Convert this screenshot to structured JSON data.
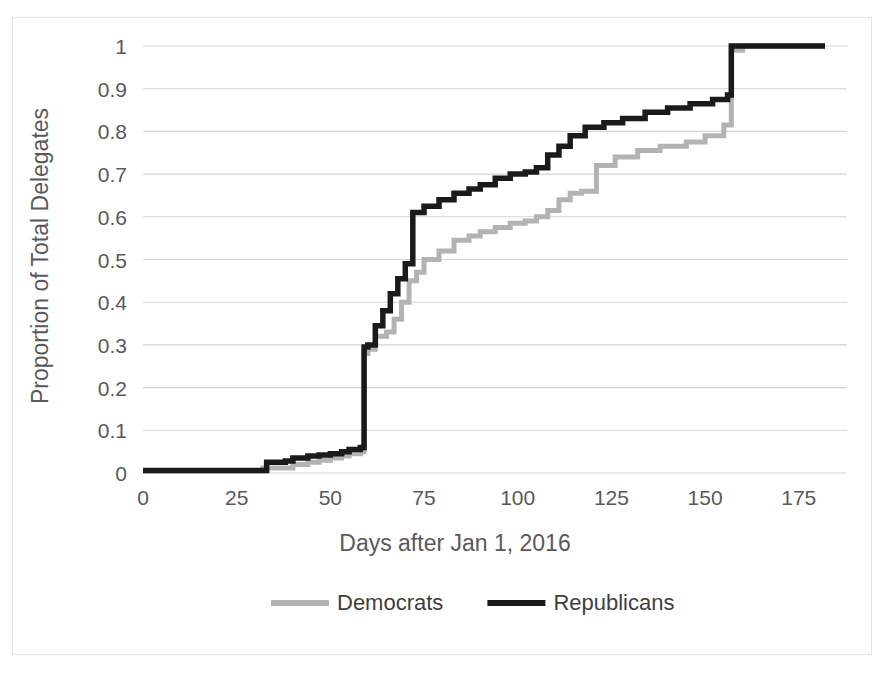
{
  "chart_data": {
    "type": "line",
    "title": "",
    "subtitle": "",
    "xlabel": "Days after Jan 1, 2016",
    "ylabel": "Proportion of Total Delegates",
    "xlim": [
      0,
      182
    ],
    "ylim": [
      0,
      1
    ],
    "xticks": [
      0,
      25,
      50,
      75,
      100,
      125,
      150,
      175
    ],
    "xtick_labels": [
      "0",
      "25",
      "50",
      "75",
      "100",
      "125",
      "150",
      "175"
    ],
    "yticks": [
      0,
      0.1,
      0.2,
      0.3,
      0.4,
      0.5,
      0.6,
      0.7,
      0.8,
      0.9,
      1
    ],
    "ytick_labels": [
      "0",
      "0.1",
      "0.2",
      "0.3",
      "0.4",
      "0.5",
      "0.6",
      "0.7",
      "0.8",
      "0.9",
      "1"
    ],
    "grid": "horizontal",
    "legend_position": "bottom",
    "step_style": "post",
    "series": [
      {
        "name": "Democrats",
        "color": "#b3b3b3",
        "stroke_width": 5,
        "x": [
          0,
          30,
          32,
          38,
          40,
          44,
          47,
          50,
          53,
          55,
          58,
          59,
          60,
          62,
          65,
          67,
          69,
          71,
          73,
          75,
          79,
          83,
          87,
          90,
          94,
          98,
          102,
          105,
          108,
          111,
          114,
          117,
          121,
          126,
          132,
          138,
          145,
          150,
          155,
          157,
          160,
          165,
          170,
          175,
          182
        ],
        "y": [
          0.005,
          0.005,
          0.012,
          0.012,
          0.02,
          0.025,
          0.03,
          0.035,
          0.04,
          0.045,
          0.05,
          0.28,
          0.29,
          0.32,
          0.33,
          0.36,
          0.4,
          0.45,
          0.47,
          0.5,
          0.52,
          0.545,
          0.555,
          0.565,
          0.575,
          0.585,
          0.59,
          0.6,
          0.615,
          0.64,
          0.655,
          0.66,
          0.72,
          0.74,
          0.755,
          0.765,
          0.775,
          0.79,
          0.815,
          0.99,
          1.0,
          1.0,
          1.0,
          1.0,
          1.0
        ]
      },
      {
        "name": "Republicans",
        "color": "#1a1a1a",
        "stroke_width": 5.5,
        "x": [
          0,
          30,
          33,
          38,
          40,
          44,
          47,
          50,
          53,
          55,
          58,
          59,
          60,
          62,
          64,
          66,
          68,
          70,
          72,
          75,
          79,
          83,
          87,
          90,
          94,
          98,
          102,
          105,
          108,
          111,
          114,
          118,
          123,
          128,
          134,
          140,
          146,
          152,
          156,
          157,
          160,
          165,
          170,
          175,
          182
        ],
        "y": [
          0.006,
          0.006,
          0.025,
          0.028,
          0.035,
          0.04,
          0.042,
          0.045,
          0.05,
          0.055,
          0.06,
          0.295,
          0.3,
          0.345,
          0.38,
          0.42,
          0.455,
          0.49,
          0.61,
          0.625,
          0.64,
          0.655,
          0.665,
          0.675,
          0.69,
          0.7,
          0.705,
          0.715,
          0.745,
          0.765,
          0.79,
          0.81,
          0.82,
          0.83,
          0.845,
          0.855,
          0.865,
          0.875,
          0.885,
          1.0,
          1.0,
          1.0,
          1.0,
          1.0,
          1.0
        ]
      }
    ],
    "legend": [
      {
        "label": "Democrats",
        "color": "#b3b3b3"
      },
      {
        "label": "Republicans",
        "color": "#1a1a1a"
      }
    ]
  }
}
